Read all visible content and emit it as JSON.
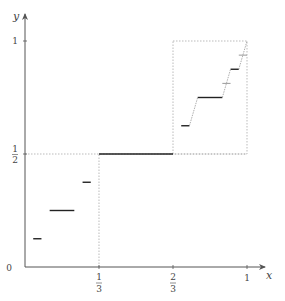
{
  "chart_data": {
    "type": "line",
    "title": "",
    "xlabel": "x",
    "ylabel": "y",
    "xlim": [
      0,
      1
    ],
    "ylim": [
      0,
      1
    ],
    "x_ticks": [
      {
        "value": 0.3333,
        "num": "1",
        "den": "3"
      },
      {
        "value": 0.6667,
        "num": "2",
        "den": "3"
      },
      {
        "value": 1,
        "label": "1"
      }
    ],
    "y_ticks": [
      {
        "value": 0,
        "label": "0"
      },
      {
        "value": 0.5,
        "num": "1",
        "den": "2"
      },
      {
        "value": 1,
        "label": "1"
      }
    ],
    "steps": [
      {
        "x0": 0.3333,
        "x1": 0.6667,
        "y": 0.5,
        "style": "dark"
      },
      {
        "x0": 0.1111,
        "x1": 0.2222,
        "y": 0.25,
        "style": "dark"
      },
      {
        "x0": 0.037,
        "x1": 0.0741,
        "y": 0.125,
        "style": "dark"
      },
      {
        "x0": 0.2593,
        "x1": 0.2963,
        "y": 0.375,
        "style": "dark"
      },
      {
        "x0": 0.7037,
        "x1": 0.7407,
        "y": 0.625,
        "style": "dark"
      },
      {
        "x0": 0.7778,
        "x1": 0.8889,
        "y": 0.75,
        "style": "dark"
      },
      {
        "x0": 0.9259,
        "x1": 0.963,
        "y": 0.875,
        "style": "dark"
      },
      {
        "x0": 0.8889,
        "x1": 0.9259,
        "y": 0.8125,
        "style": "light"
      },
      {
        "x0": 0.963,
        "x1": 1.0,
        "y": 0.9375,
        "style": "light"
      }
    ],
    "guides": [
      {
        "type": "hline",
        "y": 0.5,
        "x0": 0,
        "x1": 1
      },
      {
        "type": "vline",
        "x": 0.3333,
        "y0": 0,
        "y1": 0.5
      },
      {
        "type": "box",
        "x0": 0.6667,
        "x1": 1,
        "y0": 0.5,
        "y1": 1
      }
    ],
    "annotation": "Cantor function (devil's staircase) self-similar construction"
  },
  "colors": {
    "axis": "#555555",
    "step": "#222222",
    "light": "#999999",
    "guide": "#aaaaaa"
  }
}
